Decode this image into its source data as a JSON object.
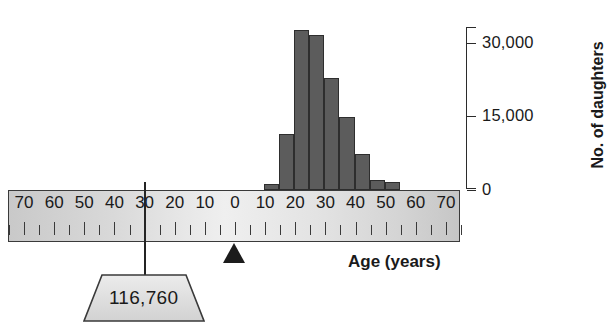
{
  "figure": {
    "name": "balance-beam-age-histogram",
    "bar_color": "#5c5c5c",
    "beam_color": "#d8d8d8"
  },
  "chart_data": {
    "type": "bar",
    "title": "",
    "xlabel": "Age (years)",
    "ylabel": "No. of daughters",
    "xlim": [
      -75,
      75
    ],
    "ylim": [
      0,
      33000
    ],
    "ytick_labels": [
      "0",
      "15,000",
      "30,000"
    ],
    "ytick_values": [
      0,
      15000,
      30000
    ],
    "grid": false,
    "legend": null,
    "bin_width": 5,
    "categories": [
      "10-15",
      "15-20",
      "20-25",
      "25-30",
      "30-35",
      "35-40",
      "40-45",
      "45-50",
      "50-55"
    ],
    "x": [
      12.5,
      17.5,
      22.5,
      27.5,
      32.5,
      37.5,
      42.5,
      47.5,
      52.5
    ],
    "values": [
      1100,
      11300,
      32300,
      31300,
      22600,
      14700,
      7100,
      1900,
      1500
    ]
  },
  "yaxis": {
    "ticks": [
      {
        "label": "30,000",
        "value": 30000
      },
      {
        "label": "15,000",
        "value": 15000
      },
      {
        "label": "0",
        "value": 0
      }
    ],
    "title": "No. of daughters"
  },
  "ruler": {
    "left_labels": [
      "70",
      "60",
      "50",
      "40",
      "30",
      "20",
      "10",
      "0"
    ],
    "right_labels": [
      "10",
      "20",
      "30",
      "40",
      "50",
      "60",
      "70"
    ],
    "all_labels": [
      "70",
      "60",
      "50",
      "40",
      "30",
      "20",
      "10",
      "0",
      "10",
      "20",
      "30",
      "40",
      "50",
      "60",
      "70"
    ],
    "tick_step": 10,
    "xtitle": "Age (years)"
  },
  "fulcrum": {
    "pivot_position_label": "0",
    "stem_position_label": "30"
  },
  "weight": {
    "value": "116,760"
  }
}
